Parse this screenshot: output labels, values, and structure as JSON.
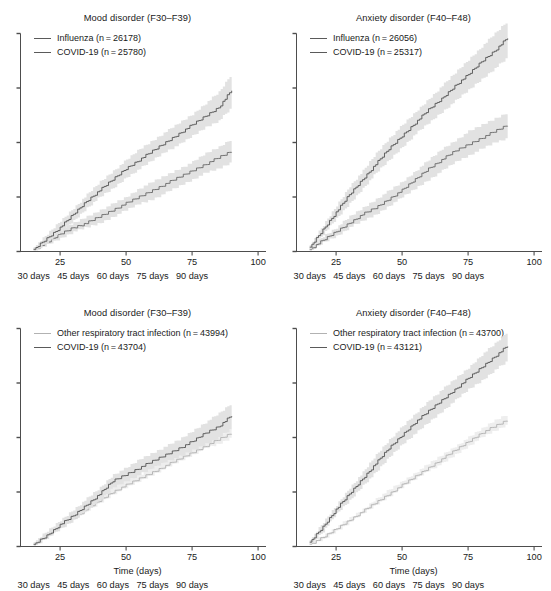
{
  "figure": {
    "top_partial_note": "",
    "axis_title": "Time (days)",
    "x_tick_labels": [
      "25",
      "50",
      "75",
      "100"
    ],
    "x_tick_values": [
      25,
      50,
      75,
      100
    ],
    "x_day_labels": [
      "30 days",
      "45 days",
      "60 days",
      "75 days",
      "90 days"
    ],
    "x_day_values": [
      15,
      30,
      45,
      60,
      75
    ],
    "colors": {
      "covid_line": "#5a5a5a",
      "comparator_line_dark": "#6e6e6e",
      "comparator_line_light": "#b4b4b4",
      "band": "#e0e0e0",
      "axis": "#4d4d4d",
      "text": "#1a1a1a"
    }
  },
  "panels": [
    {
      "id": "top-left",
      "title": "Mood disorder (F30–F39)",
      "legend": [
        {
          "label": "Influenza (n = 26178)",
          "swatch": "dark"
        },
        {
          "label": "COVID-19 (n = 25780)",
          "swatch": "dark"
        }
      ],
      "show_axis_title": false,
      "y_ticks": [
        0,
        0.25,
        0.5,
        0.75,
        1.0
      ]
    },
    {
      "id": "top-right",
      "title": "Anxiety disorder (F40–F48)",
      "legend": [
        {
          "label": "Influenza (n = 26056)",
          "swatch": "dark"
        },
        {
          "label": "COVID-19 (n = 25317)",
          "swatch": "dark"
        }
      ],
      "show_axis_title": false,
      "y_ticks": [
        0,
        0.25,
        0.5,
        0.75,
        1.0
      ]
    },
    {
      "id": "bottom-left",
      "title": "Mood disorder (F30–F39)",
      "legend": [
        {
          "label": "Other respiratory tract infection (n = 43994)",
          "swatch": "light"
        },
        {
          "label": "COVID-19 (n = 43704)",
          "swatch": "dark"
        }
      ],
      "show_axis_title": true,
      "y_ticks": [
        0,
        0.25,
        0.5,
        0.75,
        1.0
      ]
    },
    {
      "id": "bottom-right",
      "title": "Anxiety disorder (F40–F48)",
      "legend": [
        {
          "label": "Other respiratory tract infection (n = 43700)",
          "swatch": "light"
        },
        {
          "label": "COVID-19 (n = 43121)",
          "swatch": "dark"
        }
      ],
      "show_axis_title": true,
      "y_ticks": [
        0,
        0.25,
        0.5,
        0.75,
        1.0
      ]
    }
  ],
  "chart_data": {
    "type": "line",
    "xlabel": "Time (days)",
    "ylabel": "",
    "xlim": [
      10,
      103
    ],
    "ylim": [
      0,
      1.0
    ],
    "grid": false,
    "legend_position": "top-left inside axes",
    "x_axis_secondary_labels": [
      "30 days",
      "45 days",
      "60 days",
      "75 days",
      "90 days"
    ],
    "note": "y-axis tick marks are unlabelled in the source figure; y values below are relative panel heights (0 = axis baseline, 1 = top tick).",
    "panels": [
      {
        "id": "top-left",
        "title": "Mood disorder (F30-F39)",
        "x": [
          15,
          20,
          25,
          30,
          35,
          40,
          45,
          50,
          55,
          60,
          65,
          70,
          75,
          80,
          85,
          90
        ],
        "series": [
          {
            "name": "COVID-19 (n = 25780)",
            "values": [
              0.01,
              0.06,
              0.11,
              0.17,
              0.23,
              0.28,
              0.33,
              0.38,
              0.42,
              0.46,
              0.5,
              0.54,
              0.58,
              0.62,
              0.66,
              0.74
            ],
            "ci_lower": [
              0.0,
              0.04,
              0.09,
              0.14,
              0.2,
              0.25,
              0.29,
              0.34,
              0.38,
              0.42,
              0.46,
              0.49,
              0.53,
              0.57,
              0.6,
              0.66
            ],
            "ci_upper": [
              0.02,
              0.08,
              0.14,
              0.2,
              0.26,
              0.32,
              0.37,
              0.42,
              0.47,
              0.51,
              0.55,
              0.59,
              0.63,
              0.68,
              0.73,
              0.82
            ]
          },
          {
            "name": "Influenza (n = 26178)",
            "values": [
              0.01,
              0.04,
              0.08,
              0.11,
              0.13,
              0.16,
              0.19,
              0.22,
              0.25,
              0.28,
              0.31,
              0.34,
              0.37,
              0.4,
              0.43,
              0.46
            ],
            "ci_lower": [
              0.0,
              0.03,
              0.06,
              0.09,
              0.11,
              0.13,
              0.16,
              0.19,
              0.22,
              0.24,
              0.27,
              0.3,
              0.33,
              0.36,
              0.38,
              0.41
            ],
            "ci_upper": [
              0.02,
              0.06,
              0.1,
              0.13,
              0.16,
              0.19,
              0.22,
              0.25,
              0.29,
              0.32,
              0.35,
              0.38,
              0.41,
              0.45,
              0.48,
              0.52
            ]
          }
        ]
      },
      {
        "id": "top-right",
        "title": "Anxiety disorder (F40-F48)",
        "x": [
          15,
          20,
          25,
          30,
          35,
          40,
          45,
          50,
          55,
          60,
          65,
          70,
          75,
          80,
          85,
          90
        ],
        "series": [
          {
            "name": "COVID-19 (n = 25317)",
            "values": [
              0.02,
              0.1,
              0.18,
              0.26,
              0.33,
              0.4,
              0.47,
              0.53,
              0.59,
              0.65,
              0.7,
              0.76,
              0.81,
              0.87,
              0.92,
              0.98
            ],
            "ci_lower": [
              0.01,
              0.08,
              0.15,
              0.22,
              0.29,
              0.36,
              0.42,
              0.48,
              0.54,
              0.59,
              0.64,
              0.69,
              0.74,
              0.79,
              0.84,
              0.89
            ],
            "ci_upper": [
              0.03,
              0.12,
              0.21,
              0.3,
              0.37,
              0.45,
              0.52,
              0.58,
              0.64,
              0.7,
              0.76,
              0.82,
              0.88,
              0.94,
              1.0,
              1.06
            ]
          },
          {
            "name": "Influenza (n = 26056)",
            "values": [
              0.01,
              0.05,
              0.09,
              0.13,
              0.17,
              0.2,
              0.24,
              0.28,
              0.33,
              0.38,
              0.42,
              0.46,
              0.49,
              0.52,
              0.55,
              0.58
            ],
            "ci_lower": [
              0.0,
              0.04,
              0.07,
              0.11,
              0.14,
              0.17,
              0.21,
              0.25,
              0.29,
              0.33,
              0.37,
              0.41,
              0.44,
              0.47,
              0.5,
              0.52
            ],
            "ci_upper": [
              0.02,
              0.07,
              0.11,
              0.16,
              0.2,
              0.24,
              0.28,
              0.32,
              0.37,
              0.42,
              0.47,
              0.51,
              0.55,
              0.58,
              0.61,
              0.64
            ]
          }
        ]
      },
      {
        "id": "bottom-left",
        "title": "Mood disorder (F30-F39)",
        "x": [
          15,
          20,
          25,
          30,
          35,
          40,
          45,
          50,
          55,
          60,
          65,
          70,
          75,
          80,
          85,
          90
        ],
        "series": [
          {
            "name": "COVID-19 (n = 43704)",
            "values": [
              0.01,
              0.05,
              0.1,
              0.14,
              0.19,
              0.24,
              0.3,
              0.33,
              0.36,
              0.39,
              0.42,
              0.45,
              0.48,
              0.52,
              0.55,
              0.6
            ],
            "ci_lower": [
              0.0,
              0.04,
              0.08,
              0.12,
              0.17,
              0.21,
              0.27,
              0.3,
              0.33,
              0.36,
              0.39,
              0.41,
              0.44,
              0.47,
              0.5,
              0.54
            ],
            "ci_upper": [
              0.02,
              0.07,
              0.12,
              0.17,
              0.22,
              0.27,
              0.33,
              0.36,
              0.4,
              0.43,
              0.46,
              0.49,
              0.53,
              0.57,
              0.61,
              0.66
            ]
          },
          {
            "name": "Other respiratory tract infection (n = 43994)",
            "values": [
              0.01,
              0.05,
              0.09,
              0.13,
              0.17,
              0.21,
              0.25,
              0.28,
              0.31,
              0.34,
              0.37,
              0.4,
              0.43,
              0.46,
              0.49,
              0.52
            ],
            "ci_lower": [
              0.01,
              0.04,
              0.08,
              0.12,
              0.16,
              0.2,
              0.24,
              0.27,
              0.3,
              0.33,
              0.36,
              0.39,
              0.42,
              0.45,
              0.47,
              0.5
            ],
            "ci_upper": [
              0.02,
              0.06,
              0.1,
              0.14,
              0.18,
              0.23,
              0.27,
              0.3,
              0.33,
              0.36,
              0.39,
              0.42,
              0.45,
              0.48,
              0.51,
              0.55
            ]
          }
        ]
      },
      {
        "id": "bottom-right",
        "title": "Anxiety disorder (F40-F48)",
        "x": [
          15,
          20,
          25,
          30,
          35,
          40,
          45,
          50,
          55,
          60,
          65,
          70,
          75,
          80,
          85,
          90
        ],
        "series": [
          {
            "name": "COVID-19 (n = 43121)",
            "values": [
              0.02,
              0.09,
              0.17,
              0.24,
              0.31,
              0.38,
              0.45,
              0.51,
              0.57,
              0.62,
              0.67,
              0.72,
              0.77,
              0.82,
              0.87,
              0.92
            ],
            "ci_lower": [
              0.01,
              0.07,
              0.15,
              0.21,
              0.28,
              0.34,
              0.41,
              0.47,
              0.52,
              0.57,
              0.62,
              0.67,
              0.72,
              0.76,
              0.81,
              0.85
            ],
            "ci_upper": [
              0.03,
              0.11,
              0.19,
              0.27,
              0.34,
              0.42,
              0.49,
              0.55,
              0.61,
              0.67,
              0.72,
              0.77,
              0.82,
              0.88,
              0.93,
              0.99
            ]
          },
          {
            "name": "Other respiratory tract infection (n = 43700)",
            "values": [
              0.01,
              0.04,
              0.08,
              0.12,
              0.16,
              0.2,
              0.24,
              0.28,
              0.32,
              0.36,
              0.4,
              0.44,
              0.48,
              0.52,
              0.55,
              0.58
            ],
            "ci_lower": [
              0.01,
              0.03,
              0.07,
              0.11,
              0.15,
              0.19,
              0.23,
              0.27,
              0.31,
              0.35,
              0.38,
              0.42,
              0.46,
              0.5,
              0.53,
              0.56
            ],
            "ci_upper": [
              0.02,
              0.05,
              0.09,
              0.13,
              0.17,
              0.22,
              0.26,
              0.3,
              0.34,
              0.38,
              0.42,
              0.46,
              0.5,
              0.54,
              0.58,
              0.61
            ]
          }
        ]
      }
    ]
  }
}
